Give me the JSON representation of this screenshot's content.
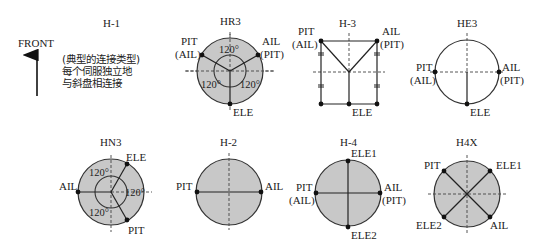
{
  "front": {
    "label": "FRONT"
  },
  "diagrams": {
    "h1": {
      "title": "H-1",
      "description": [
        "(典型的连接类型)",
        "每个伺服独立地",
        "与斜盘相连接"
      ]
    },
    "hr3": {
      "title": "HR3",
      "labels": {
        "left_top": "PIT",
        "left_bottom": "(AIL)",
        "right_top": "AIL",
        "right_bottom": "(PIT)",
        "bottom": "ELE"
      },
      "angles": [
        "120°",
        "120°",
        "120°"
      ]
    },
    "h3": {
      "title": "H-3",
      "labels": {
        "left_top": "PIT",
        "left_bottom": "(AIL)",
        "right_top": "AIL",
        "right_bottom": "(PIT)",
        "bottom": "ELE"
      }
    },
    "he3": {
      "title": "HE3",
      "labels": {
        "left_top": "PIT",
        "left_bottom": "(AIL)",
        "right_top": "AIL",
        "right_bottom": "(PIT)",
        "bottom": "ELE"
      }
    },
    "hn3": {
      "title": "HN3",
      "labels": {
        "top_right": "ELE",
        "left": "AIL",
        "bottom_right": "PIT"
      },
      "angles": [
        "120°",
        "120°",
        "120°"
      ]
    },
    "h2": {
      "title": "H-2",
      "labels": {
        "left": "PIT",
        "right": "AIL"
      }
    },
    "h4": {
      "title": "H-4",
      "labels": {
        "top": "ELE1",
        "left_top": "PIT",
        "left_bottom": "(AIL)",
        "right_top": "AIL",
        "right_bottom": "(PIT)",
        "bottom": "ELE2"
      }
    },
    "h4x": {
      "title": "H4X",
      "labels": {
        "top_left": "PIT",
        "top_right": "ELE1",
        "bottom_left": "ELE2",
        "bottom_right": "AIL"
      }
    }
  }
}
